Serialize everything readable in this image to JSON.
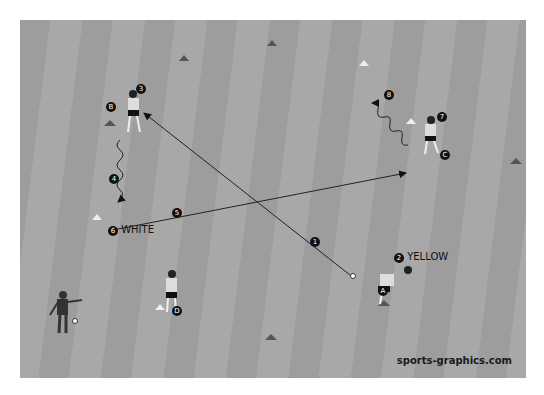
{
  "diagram": {
    "type": "soccer-drill",
    "watermark": "sports-graphics.com",
    "team_labels": {
      "white": "WHITE",
      "yellow": "YELLOW"
    },
    "step_numbers": [
      "1",
      "2",
      "3",
      "4",
      "5",
      "6",
      "7",
      "8"
    ],
    "station_letters": [
      "A",
      "B",
      "C",
      "D"
    ],
    "colors": {
      "field_dark": "#9d9d9d",
      "field_light": "#a8a8a8",
      "cone_dark": "#555555",
      "cone_white": "#eeeeee",
      "marker": "#111111"
    }
  }
}
